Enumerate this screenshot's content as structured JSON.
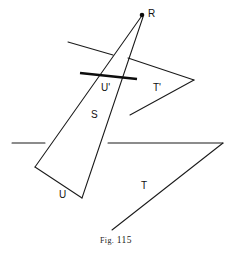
{
  "figure": {
    "caption_prefix": "Fig.",
    "caption_number": "115",
    "caption_full": "Fig. 115",
    "background_color": "#ffffff",
    "ink_color": "#111111",
    "labels": [
      {
        "id": "R",
        "text": "R",
        "x": 148,
        "y": 9
      },
      {
        "id": "Uprime",
        "text": "U'",
        "x": 101,
        "y": 83
      },
      {
        "id": "Tprime",
        "text": "T'",
        "x": 153,
        "y": 83
      },
      {
        "id": "S",
        "text": "S",
        "x": 91,
        "y": 110
      },
      {
        "id": "T",
        "text": "T",
        "x": 141,
        "y": 181
      },
      {
        "id": "U",
        "text": "U",
        "x": 59,
        "y": 190
      }
    ],
    "points": [
      {
        "id": "R",
        "x": 142,
        "y": 15
      }
    ],
    "segments": [
      {
        "id": "triangle-left-edge",
        "weight": "thin",
        "x1": 141,
        "y1": 17,
        "x2": 35,
        "y2": 167
      },
      {
        "id": "triangle-right-edge",
        "weight": "thin",
        "x1": 143,
        "y1": 17,
        "x2": 82,
        "y2": 198
      },
      {
        "id": "quad-bottom-edge",
        "weight": "thin",
        "x1": 35,
        "y1": 167,
        "x2": 82,
        "y2": 198
      },
      {
        "id": "plane-s-upper-trace",
        "weight": "thin",
        "x1": 68,
        "y1": 42,
        "x2": 113,
        "y2": 55
      },
      {
        "id": "plane-uprime-trace",
        "weight": "thick",
        "x1": 80,
        "y1": 73,
        "x2": 137,
        "y2": 79
      },
      {
        "id": "tprime-upper-ray",
        "weight": "thin",
        "x1": 128,
        "y1": 58,
        "x2": 194,
        "y2": 80
      },
      {
        "id": "tprime-lower-ray",
        "weight": "thin",
        "x1": 194,
        "y1": 80,
        "x2": 130,
        "y2": 115
      },
      {
        "id": "plane-u-trace-left",
        "weight": "thin",
        "x1": 12,
        "y1": 143,
        "x2": 45,
        "y2": 143
      },
      {
        "id": "t-horizontal-ray",
        "weight": "thin",
        "x1": 108,
        "y1": 143,
        "x2": 223,
        "y2": 143
      },
      {
        "id": "t-diagonal-ray",
        "weight": "thin",
        "x1": 223,
        "y1": 143,
        "x2": 112,
        "y2": 230
      }
    ]
  }
}
